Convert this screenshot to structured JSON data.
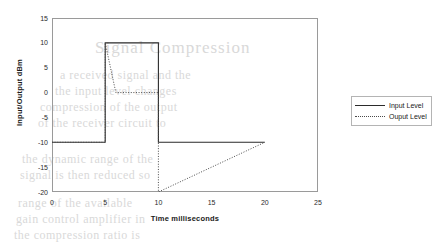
{
  "chart_data": {
    "type": "line",
    "title": "",
    "xlabel": "Time milliseconds",
    "ylabel": "Input/Output dBm",
    "xlim": [
      0,
      25
    ],
    "ylim": [
      -20,
      15
    ],
    "xticks": [
      0,
      5,
      10,
      15,
      20,
      25
    ],
    "yticks": [
      15,
      10,
      5,
      0,
      -5,
      -10,
      -15,
      -20
    ],
    "grid": false,
    "legend_position": "right",
    "series": [
      {
        "name": "Input Level",
        "style": "solid",
        "color": "#2b2b2b",
        "points": [
          {
            "x": 0,
            "y": -10
          },
          {
            "x": 5,
            "y": -10
          },
          {
            "x": 5,
            "y": 10
          },
          {
            "x": 10,
            "y": 10
          },
          {
            "x": 10,
            "y": -10
          },
          {
            "x": 20,
            "y": -10
          }
        ]
      },
      {
        "name": "Ouput Level",
        "style": "dotted",
        "color": "#4a4a4a",
        "points": [
          {
            "x": 0,
            "y": -10
          },
          {
            "x": 5,
            "y": -10
          },
          {
            "x": 5,
            "y": 10
          },
          {
            "x": 6,
            "y": 0
          },
          {
            "x": 10,
            "y": 0
          },
          {
            "x": 10,
            "y": -20
          },
          {
            "x": 20,
            "y": -10
          }
        ]
      }
    ]
  },
  "axes": {
    "y_title": "Input/Output dBm",
    "x_title": "Time milliseconds",
    "y_tick_labels": [
      "15",
      "10",
      "5",
      "0",
      "-5",
      "-10",
      "-15",
      "-20"
    ],
    "x_tick_labels": [
      "0",
      "5",
      "10",
      "15",
      "20",
      "25"
    ]
  },
  "legend": {
    "entries": [
      {
        "label": "Input Level",
        "style": "solid"
      },
      {
        "label": "Ouput Level",
        "style": "dotted"
      }
    ]
  },
  "artifacts": {
    "bleed_text": [
      "Signal Compression",
      "a received signal and the",
      "the input level changes",
      "compression of the output",
      "of the receiver circuit to",
      "the dynamic range of the",
      "signal is then reduced so",
      "range of the available",
      "gain control amplifier in",
      "the compression ratio is"
    ]
  }
}
